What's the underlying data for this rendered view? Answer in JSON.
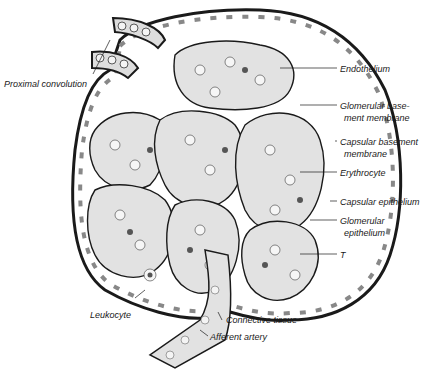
{
  "figure": {
    "labels": {
      "proximal_convolution": "Proximal convolution",
      "endothelium": "Endothelium",
      "glomerular_basement_1": "Glomerular base-",
      "glomerular_basement_2": "ment membrane",
      "capsular_basement_1": "Capsular basement",
      "capsular_basement_2": "membrane",
      "erythrocyte": "Erythrocyte",
      "capsular_epithelium": "Capsular epithelium",
      "glomerular_epithelium_1": "Glomerular",
      "glomerular_epithelium_2": "epithelium",
      "t": "T",
      "leukocyte": "Leukocyte",
      "connective_tissue": "Connective tissue",
      "afferent_artery": "Afferent artery"
    },
    "colors": {
      "ink": "#1a1a1a",
      "tissue_fill": "#e2e2e2",
      "cell_fill": "#f4f4f4"
    }
  }
}
